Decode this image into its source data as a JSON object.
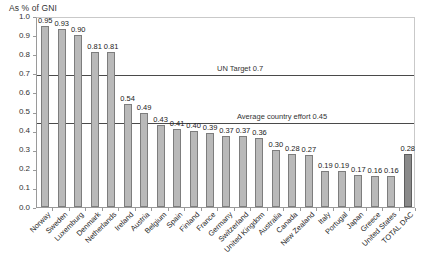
{
  "chart_data": {
    "type": "bar",
    "title": "As % of GNI",
    "xlabel": "",
    "ylabel": "",
    "ylim": [
      0.0,
      1.0
    ],
    "grid": false,
    "legend": "none",
    "ytick_labels": [
      "1.0",
      "0.9",
      "0.8",
      "0.7",
      "0.6",
      "0.5",
      "0.4",
      "0.3",
      "0.2",
      "0.1",
      "0.0"
    ],
    "ytick_values": [
      1.0,
      0.9,
      0.8,
      0.7,
      0.6,
      0.5,
      0.4,
      0.3,
      0.2,
      0.1,
      0.0
    ],
    "categories": [
      "Norway",
      "Sweden",
      "Luxemburg",
      "Denmark",
      "Netherlands",
      "Ireland",
      "Austria",
      "Belgium",
      "Spain",
      "Finland",
      "France",
      "Germany",
      "Switzerland",
      "United Kingdom",
      "Australia",
      "Canada",
      "New Zealand",
      "Italy",
      "Portugal",
      "Japan",
      "Greece",
      "United States",
      "TOTAL DAC"
    ],
    "values": [
      0.95,
      0.93,
      0.9,
      0.81,
      0.81,
      0.54,
      0.49,
      0.43,
      0.41,
      0.4,
      0.39,
      0.37,
      0.37,
      0.36,
      0.3,
      0.28,
      0.27,
      0.19,
      0.19,
      0.17,
      0.16,
      0.16,
      0.28
    ],
    "value_labels": [
      "0.95",
      "0.93",
      "0.90",
      "0.81",
      "0.81",
      "0.54",
      "0.49",
      "0.43",
      "0.41",
      "0.40",
      "0.39",
      "0.37",
      "0.37",
      "0.36",
      "0.30",
      "0.28",
      "0.27",
      "0.19",
      "0.19",
      "0.17",
      "0.16",
      "0.16",
      "0.28"
    ],
    "highlight_index": 22,
    "annotations": [
      {
        "label": "UN Target 0.7",
        "value": 0.7
      },
      {
        "label": "Average country effort 0.45",
        "value": 0.45
      }
    ],
    "colors": {
      "bar_fill": "#b9b9b9",
      "bar_border": "#7d7d7d",
      "total_fill": "#8a8a8a",
      "total_border": "#5e5e5e",
      "reference_line": "#4a4a4a",
      "axis": "#9a9a9a",
      "text": "#1f1f1f",
      "background": "#ffffff"
    }
  }
}
